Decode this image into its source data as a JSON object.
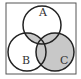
{
  "diagram": {
    "type": "venn",
    "sets": [
      {
        "label": "A",
        "cx": 42,
        "cy": 25,
        "r": 19
      },
      {
        "label": "B",
        "cx": 27,
        "cy": 52,
        "r": 19
      },
      {
        "label": "C",
        "cx": 55,
        "cy": 52,
        "r": 19
      }
    ],
    "shaded_regions": "(A ∩ B) ∪ C",
    "colors": {
      "shade": "#c8c8c8",
      "stroke": "#222222",
      "frame": "#555555",
      "background": "#ffffff"
    }
  }
}
